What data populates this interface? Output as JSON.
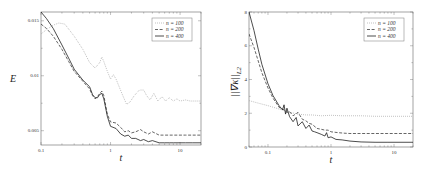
{
  "chart_data": [
    {
      "type": "line",
      "title": "",
      "xlabel": "t",
      "ylabel": "E",
      "xscale": "log",
      "xlim": [
        0.1,
        20
      ],
      "ylim": [
        0.0037,
        0.0158
      ],
      "xticks": [
        0.1,
        1,
        10
      ],
      "xtick_labels": [
        "0.1",
        "1",
        "10"
      ],
      "yticks": [
        0.005,
        0.01,
        0.015
      ],
      "ytick_labels": [
        "0.005",
        "0.01",
        "0.015"
      ],
      "grid": false,
      "legend_position": "upper right",
      "series": [
        {
          "name": "n = 100",
          "style": "dotted",
          "color": "#aaaaaa",
          "x": [
            0.1,
            0.12,
            0.15,
            0.18,
            0.22,
            0.3,
            0.4,
            0.5,
            0.6,
            0.7,
            0.75,
            0.8,
            0.9,
            1.0,
            1.1,
            1.2,
            1.35,
            1.5,
            1.7,
            1.9,
            2.2,
            2.6,
            3.0,
            3.3,
            3.7,
            4.2,
            4.8,
            5.5,
            6.2,
            7,
            8,
            9,
            10,
            12,
            14,
            17,
            20
          ],
          "y": [
            0.0138,
            0.0142,
            0.0146,
            0.0148,
            0.0147,
            0.0136,
            0.0124,
            0.0112,
            0.0107,
            0.0112,
            0.0117,
            0.0113,
            0.0104,
            0.0097,
            0.0101,
            0.0097,
            0.0089,
            0.0082,
            0.0074,
            0.0076,
            0.0082,
            0.0087,
            0.0087,
            0.0082,
            0.0078,
            0.0084,
            0.0077,
            0.0081,
            0.0077,
            0.008,
            0.0077,
            0.0079,
            0.0077,
            0.0078,
            0.0077,
            0.0077,
            0.0077
          ]
        },
        {
          "name": "n = 200",
          "style": "dashed",
          "color": "#333333",
          "x": [
            0.1,
            0.12,
            0.15,
            0.2,
            0.25,
            0.3,
            0.4,
            0.5,
            0.55,
            0.6,
            0.65,
            0.7,
            0.75,
            0.8,
            0.9,
            1.0,
            1.2,
            1.4,
            1.6,
            1.8,
            2.0,
            2.3,
            2.7,
            3.0,
            3.5,
            4,
            5,
            6,
            7,
            8,
            10,
            12,
            15,
            20
          ],
          "y": [
            0.0147,
            0.0143,
            0.0136,
            0.0124,
            0.0113,
            0.0104,
            0.0095,
            0.0088,
            0.0082,
            0.0079,
            0.0081,
            0.0084,
            0.0086,
            0.0082,
            0.0065,
            0.0058,
            0.0057,
            0.0053,
            0.0049,
            0.005,
            0.0048,
            0.0049,
            0.0051,
            0.0049,
            0.0047,
            0.0049,
            0.0046,
            0.0046,
            0.0046,
            0.0046,
            0.0046,
            0.0046,
            0.0046,
            0.0046
          ]
        },
        {
          "name": "n = 400",
          "style": "solid",
          "color": "#111111",
          "x": [
            0.1,
            0.12,
            0.15,
            0.2,
            0.25,
            0.3,
            0.4,
            0.5,
            0.55,
            0.6,
            0.65,
            0.7,
            0.75,
            0.8,
            0.9,
            1.0,
            1.2,
            1.4,
            1.6,
            1.8,
            2.0,
            2.3,
            2.7,
            3.0,
            3.5,
            4,
            5,
            6,
            7,
            8,
            10,
            12,
            15,
            20
          ],
          "y": [
            0.0158,
            0.0152,
            0.0143,
            0.0128,
            0.0116,
            0.0106,
            0.0096,
            0.009,
            0.0083,
            0.008,
            0.008,
            0.0083,
            0.0084,
            0.0079,
            0.0063,
            0.0054,
            0.0052,
            0.0047,
            0.0045,
            0.0046,
            0.0043,
            0.0043,
            0.0041,
            0.0042,
            0.004,
            0.0041,
            0.0039,
            0.0039,
            0.0039,
            0.0039,
            0.0039,
            0.0039,
            0.0039,
            0.0039
          ]
        }
      ]
    },
    {
      "type": "line",
      "title": "",
      "xlabel": "t",
      "ylabel": "||∇κ||L2",
      "ylabel_main": "||∇κ||",
      "ylabel_sub": "L2",
      "xscale": "log",
      "xlim": [
        0.05,
        20
      ],
      "ylim": [
        0,
        8
      ],
      "xticks": [
        0.1,
        1,
        10
      ],
      "xtick_labels": [
        "0.1",
        "1",
        "10"
      ],
      "yticks": [
        0,
        2,
        4,
        6,
        8
      ],
      "ytick_labels": [
        "0",
        "2",
        "4",
        "6",
        "8"
      ],
      "grid": false,
      "legend_position": "upper right",
      "series": [
        {
          "name": "n = 100",
          "style": "dotted",
          "color": "#aaaaaa",
          "x": [
            0.05,
            0.07,
            0.1,
            0.15,
            0.2,
            0.3,
            0.4,
            0.5,
            0.7,
            1,
            1.5,
            2,
            3,
            5,
            8,
            12,
            20
          ],
          "y": [
            2.75,
            2.6,
            2.45,
            2.25,
            2.1,
            1.95,
            1.9,
            1.9,
            1.85,
            1.88,
            1.85,
            1.85,
            1.85,
            1.82,
            1.82,
            1.82,
            1.82
          ]
        },
        {
          "name": "n = 200",
          "style": "dashed",
          "color": "#333333",
          "x": [
            0.05,
            0.06,
            0.07,
            0.08,
            0.1,
            0.12,
            0.15,
            0.18,
            0.2,
            0.22,
            0.25,
            0.3,
            0.35,
            0.4,
            0.45,
            0.5,
            0.6,
            0.7,
            0.8,
            0.9,
            1,
            1.3,
            1.6,
            2,
            3,
            5,
            8,
            12,
            20
          ],
          "y": [
            6.7,
            5.9,
            5.1,
            4.4,
            3.5,
            2.9,
            2.35,
            2.2,
            2.05,
            2.1,
            1.85,
            2.05,
            1.65,
            1.55,
            1.4,
            1.35,
            1.1,
            1.05,
            1.0,
            1.0,
            0.9,
            0.85,
            0.82,
            0.8,
            0.8,
            0.8,
            0.8,
            0.8,
            0.8
          ]
        },
        {
          "name": "n = 400",
          "style": "solid",
          "color": "#111111",
          "x": [
            0.05,
            0.06,
            0.07,
            0.08,
            0.1,
            0.12,
            0.15,
            0.17,
            0.18,
            0.19,
            0.2,
            0.22,
            0.25,
            0.28,
            0.3,
            0.35,
            0.4,
            0.45,
            0.5,
            0.55,
            0.6,
            0.7,
            0.8,
            0.85,
            0.9,
            1,
            1.2,
            1.5,
            2,
            3,
            5,
            8,
            12,
            20
          ],
          "y": [
            8.0,
            6.9,
            5.8,
            4.9,
            3.75,
            3.05,
            2.45,
            2.2,
            2.5,
            1.95,
            2.3,
            1.8,
            1.5,
            1.75,
            1.25,
            1.5,
            1.1,
            1.3,
            0.95,
            0.9,
            0.85,
            0.75,
            0.65,
            0.85,
            0.55,
            0.6,
            0.45,
            0.42,
            0.35,
            0.3,
            0.28,
            0.28,
            0.28,
            0.28
          ]
        }
      ]
    }
  ]
}
